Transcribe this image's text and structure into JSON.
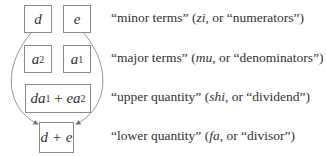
{
  "diagram": {
    "boxes": {
      "d": "d",
      "e": "e",
      "a2_base": "a",
      "a2_sub": "2",
      "a1_base": "a",
      "a1_sub": "1",
      "upper": {
        "t1": "da",
        "s1": "1",
        "op": " + ",
        "t2": "ea",
        "s2": "2"
      },
      "lower": "d + e"
    },
    "labels": [
      {
        "pre": "“minor terms” (",
        "term": "zi",
        "post": ", or “numerators”)"
      },
      {
        "pre": "“major terms” (",
        "term": "mu",
        "post": ", or “denominators”)"
      },
      {
        "pre": "“upper quantity” (",
        "term": "shi",
        "post": ", or “dividend”)"
      },
      {
        "pre": "“lower quantity” (",
        "term": "fa",
        "post": ", or “divisor”)"
      }
    ],
    "colors": {
      "border": "#8a8a8a",
      "curve": "#888888",
      "text": "#333333"
    }
  }
}
